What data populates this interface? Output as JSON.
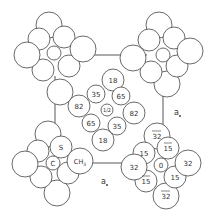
{
  "diagram": {
    "type": "crystal-structure-projection",
    "axis_labels": {
      "a_right": "a",
      "a_bottom": "a"
    },
    "central_molecule": {
      "center_label": "1/2",
      "atom_labels": [
        "18",
        "35",
        "65",
        "82",
        "82",
        "65",
        "35",
        "18"
      ]
    },
    "bottom_left_molecule": {
      "center_label": "C",
      "s_label": "S",
      "ch3_label": "CH3",
      "ch3_sub": "3"
    },
    "bottom_right_molecule": {
      "center_label": "0",
      "atom_labels": [
        "32",
        "15",
        "15",
        "32",
        "32",
        "15",
        "15",
        "32"
      ],
      "overbar_labels": [
        "32",
        "15",
        "15",
        "32"
      ]
    }
  }
}
